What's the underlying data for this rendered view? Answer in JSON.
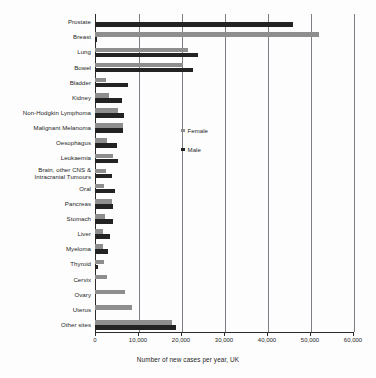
{
  "chart_data": {
    "type": "bar",
    "orientation": "horizontal",
    "title": "",
    "xlabel": "Number of new cases per year, UK",
    "ylabel": "",
    "xlim": [
      0,
      60000
    ],
    "xticks": [
      0,
      10000,
      20000,
      30000,
      40000,
      50000,
      60000
    ],
    "xtick_labels": [
      "0",
      "10,000",
      "20,000",
      "30,000",
      "40,000",
      "50,000",
      "60,000"
    ],
    "grid": true,
    "grid_axis": "x",
    "legend_position": "center-left-inside",
    "categories": [
      "Prostate",
      "Breast",
      "Lung",
      "Bowel",
      "Bladder",
      "Kidney",
      "Non-Hodgkin Lymphoma",
      "Malignant Melanoma",
      "Oesophagus",
      "Leukaemia",
      "Brain, other CNS & Intracranial Tumours",
      "Oral",
      "Pancreas",
      "Stomach",
      "Liver",
      "Myeloma",
      "Thyroid",
      "Cervix",
      "Ovary",
      "Uterus",
      "Other sites"
    ],
    "series": [
      {
        "name": "Female",
        "color": "#8e8e8e",
        "values": [
          0,
          52000,
          21600,
          20500,
          2600,
          3300,
          5400,
          6400,
          2700,
          4200,
          2500,
          2100,
          3900,
          2400,
          1800,
          1900,
          2000,
          2900,
          7000,
          8700,
          17800
        ]
      },
      {
        "name": "Male",
        "color": "#232323",
        "values": [
          46000,
          400,
          24000,
          22800,
          7700,
          6300,
          6700,
          6600,
          5100,
          5300,
          3900,
          4600,
          4200,
          4100,
          3400,
          3000,
          600,
          0,
          0,
          0,
          18800
        ]
      }
    ]
  },
  "legend": {
    "items": [
      {
        "label": "Female",
        "marker": "square-gray"
      },
      {
        "label": "Male",
        "marker": "square-black"
      }
    ]
  }
}
